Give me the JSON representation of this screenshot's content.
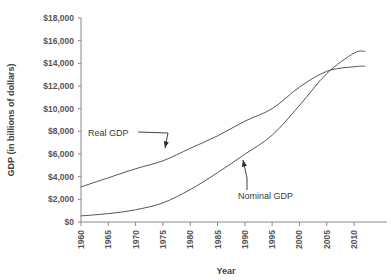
{
  "chart_data": {
    "type": "line",
    "title": "",
    "xlabel": "Year",
    "ylabel": "GDP (in billions of dollars)",
    "xlim": [
      1960,
      2012
    ],
    "ylim": [
      0,
      18000
    ],
    "grid": false,
    "legend_position": "inline-annotations",
    "x_tick_labels": [
      "1960",
      "1965",
      "1970",
      "1975",
      "1980",
      "1985",
      "1990",
      "1995",
      "2000",
      "2005",
      "2010"
    ],
    "x_ticks": [
      1960,
      1965,
      1970,
      1975,
      1980,
      1985,
      1990,
      1995,
      2000,
      2005,
      2010
    ],
    "y_tick_labels": [
      "$0",
      "$2,000",
      "$4,000",
      "$6,000",
      "$8,000",
      "$10,000",
      "$12,000",
      "$14,000",
      "$16,000",
      "$18,000"
    ],
    "y_ticks": [
      0,
      2000,
      4000,
      6000,
      8000,
      10000,
      12000,
      14000,
      16000,
      18000
    ],
    "x": [
      1960,
      1965,
      1970,
      1975,
      1980,
      1985,
      1990,
      1995,
      2000,
      2005,
      2010,
      2012
    ],
    "series": [
      {
        "name": "Real GDP",
        "color": "#555555",
        "values": [
          3100,
          3900,
          4700,
          5400,
          6500,
          7600,
          8900,
          10000,
          11900,
          13300,
          13700,
          13750
        ]
      },
      {
        "name": "Nominal GDP",
        "color": "#555555",
        "values": [
          540,
          740,
          1080,
          1690,
          2860,
          4350,
          5980,
          7660,
          10280,
          13100,
          14900,
          15050
        ]
      }
    ],
    "annotations": [
      {
        "text": "Real GDP",
        "series": "Real GDP",
        "point_year": 1979,
        "point_value": 6300
      },
      {
        "text": "Nominal GDP",
        "series": "Nominal GDP",
        "point_year": 1991,
        "point_value": 6350
      }
    ]
  }
}
